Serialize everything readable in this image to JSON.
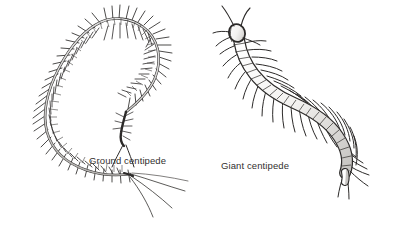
{
  "plate": {
    "name": "centipede-comparison-plate",
    "background_color": "#ffffff",
    "ink_color": "#2a2a2a",
    "body_fill_color": "#f2f1ef",
    "body_shade_color": "#c9c7c4",
    "label_color": "#32302f",
    "width": 398,
    "height": 237
  },
  "figures": [
    {
      "id": "ground-centipede",
      "label": "Ground centipede",
      "label_x": 89,
      "label_y": 155,
      "description": "slender elongate centipede curved in a broad hook, numerous fine slender legs, long trailing terminal legs",
      "body_style": "slender",
      "leg_count_drawn": 44,
      "orientation": "head lower-center, body arching up and around to the left and down to tail at lower left"
    },
    {
      "id": "giant-centipede",
      "label": "Giant centipede",
      "label_x": 221,
      "label_y": 160,
      "description": "robust broadly segmented centipede in an S-curve, stout tapering legs, long curved antennae at head",
      "body_style": "robust",
      "leg_count_drawn": 23,
      "orientation": "head upper left with antennae, body sweeping down to the right and curving to tail at lower right"
    }
  ]
}
